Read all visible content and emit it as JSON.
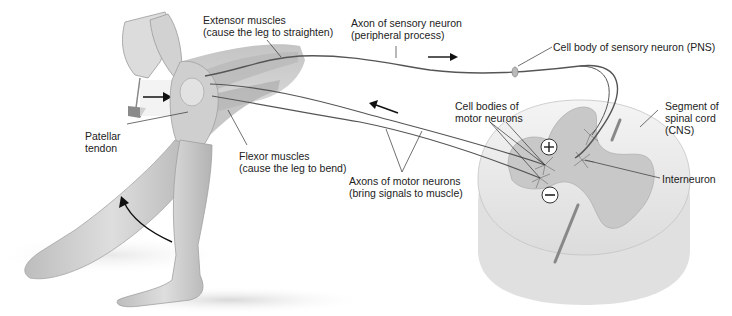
{
  "diagram": {
    "colors": {
      "skin": "#d6d6d6",
      "skin_shadow": "#a9a9a9",
      "spinal_white": "#f1f1f1",
      "spinal_gray": "#c9c9c9",
      "nerve": "#555555",
      "text": "#222222"
    },
    "labels": {
      "extensor": {
        "line1": "Extensor muscles",
        "line2": "(cause the leg to straighten)"
      },
      "sensory_axon": {
        "line1": "Axon of sensory neuron",
        "line2": "(peripheral process)"
      },
      "sensory_cell_body": {
        "line1": "Cell body of sensory neuron (PNS)"
      },
      "segment": {
        "line1": "Segment of",
        "line2": "spinal cord",
        "line3": "(CNS)"
      },
      "motor_cell_bodies": {
        "line1": "Cell bodies of",
        "line2": "motor neurons"
      },
      "interneuron": {
        "line1": "Interneuron"
      },
      "patellar": {
        "line1": "Patellar",
        "line2": "tendon"
      },
      "flexor": {
        "line1": "Flexor muscles",
        "line2": "(cause the leg to bend)"
      },
      "motor_axons": {
        "line1": "Axons of motor neurons",
        "line2": "(bring signals to muscle)"
      }
    },
    "symbols": {
      "excitatory": "+",
      "inhibitory": "−"
    }
  }
}
